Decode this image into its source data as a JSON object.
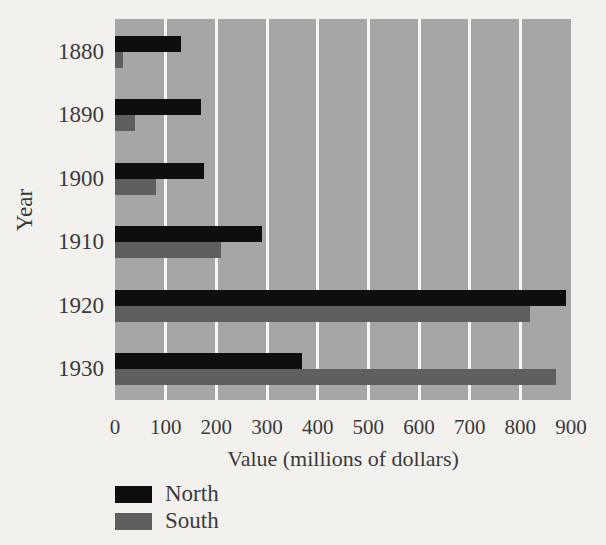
{
  "page": {
    "background": "#f3f1ee",
    "text_color": "#3a3a3a"
  },
  "chart_data": {
    "type": "bar",
    "orientation": "horizontal",
    "title": "",
    "xlabel": "Value (millions of dollars)",
    "ylabel": "Year",
    "categories": [
      "1880",
      "1890",
      "1900",
      "1910",
      "1920",
      "1930"
    ],
    "series": [
      {
        "name": "North",
        "color": "#0e0e0e",
        "values": [
          130,
          170,
          175,
          290,
          890,
          370
        ]
      },
      {
        "name": "South",
        "color": "#5f5f5f",
        "values": [
          15,
          40,
          80,
          210,
          820,
          870
        ]
      }
    ],
    "xlim": [
      0,
      900
    ],
    "xticks": [
      0,
      100,
      200,
      300,
      400,
      500,
      600,
      700,
      800,
      900
    ],
    "grid": true,
    "gridline_color": "#f8f7f5",
    "gridline_ticks": [
      100,
      200,
      300,
      400,
      500,
      600,
      700,
      800
    ],
    "plot_background": "#a6a6a6",
    "legend_position": "bottom-left",
    "legend_entries": [
      "North",
      "South"
    ]
  }
}
